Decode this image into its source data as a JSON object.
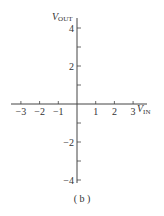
{
  "chart_data": {
    "type": "line",
    "title": "",
    "caption": "(b)",
    "xlabel": "V_IN",
    "ylabel": "V_OUT",
    "xlim": [
      -3.5,
      3.7
    ],
    "ylim": [
      -4.1,
      4.6
    ],
    "x_ticks": [
      -3,
      -2,
      -1,
      1,
      2,
      3
    ],
    "x_tick_labels": [
      "−3",
      "−2",
      "−1",
      "1",
      "2",
      "3"
    ],
    "y_ticks": [
      -4,
      -3,
      -2,
      -1,
      1,
      2,
      3,
      4
    ],
    "y_tick_labels": [
      "−4",
      "",
      "−2",
      "",
      "",
      "2",
      "",
      "4"
    ],
    "series": [],
    "grid": false,
    "legend": null
  },
  "labels": {
    "xlabel_main": "V",
    "xlabel_sub": "IN",
    "ylabel_main": "V",
    "ylabel_sub": "OUT",
    "caption": "( b )"
  }
}
